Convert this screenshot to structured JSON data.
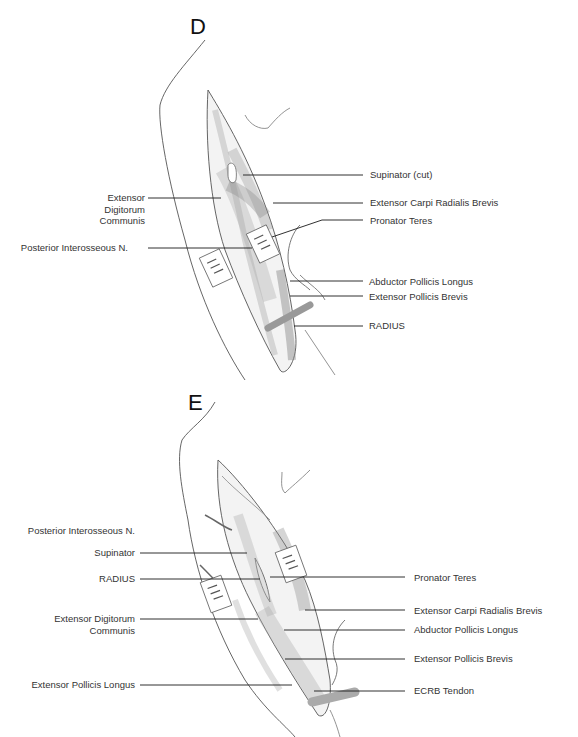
{
  "panels": [
    {
      "letter": "D",
      "labels_left": [
        {
          "text": "Extensor\nDigitorum\nCommunis",
          "line1": "Extensor",
          "line2": "Digitorum",
          "line3": "Communis"
        },
        {
          "text": "Posterior Interosseous N."
        }
      ],
      "labels_right": [
        {
          "text": "Supinator (cut)"
        },
        {
          "text": "Extensor Carpi Radialis Brevis"
        },
        {
          "text": "Pronator Teres"
        },
        {
          "text": "Abductor Pollicis Longus"
        },
        {
          "text": "Extensor Pollicis Brevis"
        },
        {
          "text": "RADIUS"
        }
      ]
    },
    {
      "letter": "E",
      "labels_left": [
        {
          "text": "Posterior Interosseous N."
        },
        {
          "text": "Supinator"
        },
        {
          "text": "RADIUS"
        },
        {
          "text": "Extensor Digitorum",
          "line2": "Communis"
        },
        {
          "text": "Extensor Pollicis Longus"
        }
      ],
      "labels_right": [
        {
          "text": "Pronator Teres"
        },
        {
          "text": "Extensor Carpi Radialis Brevis"
        },
        {
          "text": "Abductor Pollicis Longus"
        },
        {
          "text": "Extensor Pollicis Brevis"
        },
        {
          "text": "ECRB Tendon"
        }
      ]
    }
  ],
  "colors": {
    "leader_line": "#1a1a1a",
    "highlight_leader_start": "#b0103a",
    "highlight_leader_mid": "#e8903a",
    "sketch_stroke": "#555555",
    "muscle_shade": "#cfcfcf"
  }
}
